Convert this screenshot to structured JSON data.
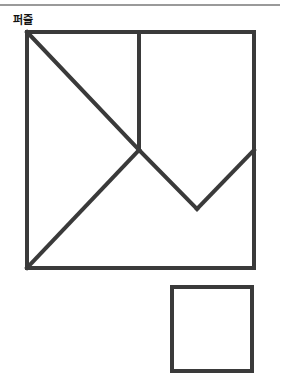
{
  "header": {
    "title": "퍼즐"
  },
  "colors": {
    "stroke": "#3a3a3a",
    "rule": "#9a9a9a"
  },
  "figure": {
    "big_square": {
      "x": 27,
      "y": 32,
      "w": 227,
      "h": 236
    },
    "segments": [
      {
        "name": "diagonal-top-left-to-center",
        "x1": 27,
        "y1": 32,
        "x2": 139,
        "y2": 150
      },
      {
        "name": "vertical-center",
        "x1": 139,
        "y1": 32,
        "x2": 139,
        "y2": 150
      },
      {
        "name": "diagonal-bottom-left-to-center",
        "x1": 27,
        "y1": 268,
        "x2": 139,
        "y2": 150
      },
      {
        "name": "v-left",
        "x1": 139,
        "y1": 150,
        "x2": 197,
        "y2": 209
      },
      {
        "name": "v-right",
        "x1": 197,
        "y1": 209,
        "x2": 254,
        "y2": 150
      }
    ],
    "small_square": {
      "x": 172,
      "y": 287,
      "w": 80,
      "h": 84
    }
  }
}
